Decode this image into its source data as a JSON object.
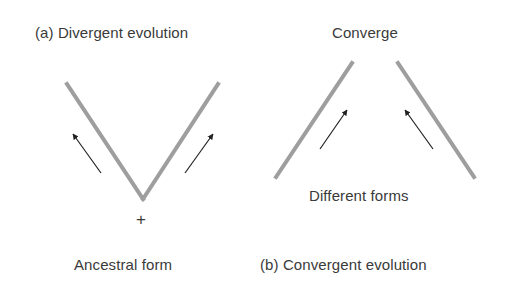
{
  "colors": {
    "line": "#9e9e9e",
    "arrow": "#222222",
    "text": "#3a3a3a",
    "background": "#ffffff"
  },
  "panel_a": {
    "title": "(a) Divergent evolution",
    "bottom_label": "Ancestral form",
    "origin_marker": "+"
  },
  "panel_b": {
    "title": "(b) Convergent evolution",
    "top_label": "Converge",
    "middle_label": "Different forms"
  }
}
